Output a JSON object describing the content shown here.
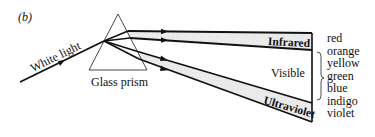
{
  "figure": {
    "panel_label": "(b)",
    "incoming_ray_label": "White light",
    "prism_label": "Glass prism",
    "band_labels": {
      "infrared": "Infrared",
      "visible": "Visible",
      "ultraviolet": "Ultraviolet"
    },
    "visible_colors": [
      "red",
      "orange",
      "yellow",
      "green",
      "blue",
      "indigo",
      "violet"
    ],
    "colors": {
      "line": "#111111",
      "band_fill": "#e6e6e6",
      "background": "#ffffff"
    }
  }
}
